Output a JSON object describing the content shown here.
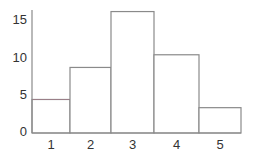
{
  "chart_data": {
    "type": "bar",
    "title": "",
    "xlabel": "",
    "ylabel": "",
    "categories": [
      "1",
      "2",
      "3",
      "4",
      "5"
    ],
    "values": [
      4.5,
      8.8,
      16.3,
      10.5,
      3.4
    ],
    "ylim": [
      0,
      16.5
    ],
    "yticks": [
      0,
      5,
      10,
      15
    ],
    "ytick_labels": [
      "0",
      "5",
      "10",
      "15"
    ],
    "xtick_labels": [
      "1",
      "2",
      "3",
      "4",
      "5"
    ],
    "grid": false,
    "legend": null,
    "bar_gap": 0,
    "style": {
      "bar_fill": "#ffffff",
      "bar_stroke": "#8a8a8a",
      "first_bar_top_stroke": "#9a7f88",
      "axis_color": "#8a8a8a",
      "text_color": "#333333"
    }
  }
}
